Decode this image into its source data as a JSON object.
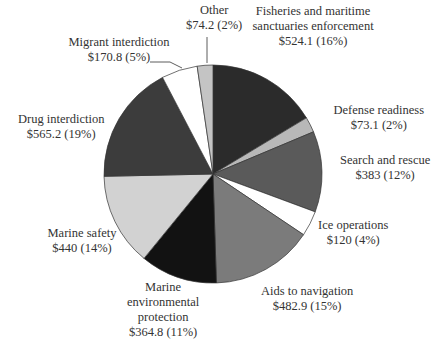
{
  "chart_data": {
    "type": "pie",
    "title": "",
    "start_angle_deg": 0,
    "direction": "clockwise",
    "units": "$ (millions)",
    "slices": [
      {
        "label": "Fisheries and maritime sanctuaries enforcement",
        "value": 524.1,
        "percent": 16,
        "color": "#2b2b2b"
      },
      {
        "label": "Defense readiness",
        "value": 73.1,
        "percent": 2,
        "color": "#b8b8b8"
      },
      {
        "label": "Search and rescue",
        "value": 383,
        "percent": 12,
        "color": "#5a5a5a"
      },
      {
        "label": "Ice operations",
        "value": 120,
        "percent": 4,
        "color": "#ffffff"
      },
      {
        "label": "Aids to navigation",
        "value": 482.9,
        "percent": 15,
        "color": "#7b7b7b"
      },
      {
        "label": "Marine environmental protection",
        "value": 364.8,
        "percent": 11,
        "color": "#121212"
      },
      {
        "label": "Marine safety",
        "value": 440,
        "percent": 14,
        "color": "#d2d2d2"
      },
      {
        "label": "Drug interdiction",
        "value": 565.2,
        "percent": 19,
        "color": "#3c3c3c"
      },
      {
        "label": "Migrant interdiction",
        "value": 170.8,
        "percent": 5,
        "color": "#ffffff"
      },
      {
        "label": "Other",
        "value": 74.2,
        "percent": 2,
        "color": "#c4c4c4"
      }
    ]
  },
  "labels": [
    {
      "lines": [
        "Fisheries and maritime",
        "sanctuaries enforcement",
        "$524.1 (16%)"
      ],
      "x": 313,
      "y": 4
    },
    {
      "lines": [
        "Defense readiness",
        "$73.1 (2%)"
      ],
      "x": 379,
      "y": 103
    },
    {
      "lines": [
        "Search and rescue",
        "$383 (12%)"
      ],
      "x": 385,
      "y": 153
    },
    {
      "lines": [
        "Ice operations",
        "$120 (4%)"
      ],
      "x": 353,
      "y": 218
    },
    {
      "lines": [
        "Aids to navigation",
        "$482.9 (15%)"
      ],
      "x": 307,
      "y": 284
    },
    {
      "lines": [
        "Marine",
        "environmental",
        "protection",
        "$364.8 (11%)"
      ],
      "x": 163,
      "y": 280
    },
    {
      "lines": [
        "Marine safety",
        "$440 (14%)"
      ],
      "x": 82,
      "y": 226
    },
    {
      "lines": [
        "Drug interdiction",
        "$565.2 (19%)"
      ],
      "x": 61,
      "y": 112
    },
    {
      "lines": [
        "Migrant interdiction",
        "$170.8 (5%)"
      ],
      "x": 119,
      "y": 35
    },
    {
      "lines": [
        "Other",
        "$74.2 (2%)"
      ],
      "x": 214,
      "y": 3
    }
  ]
}
